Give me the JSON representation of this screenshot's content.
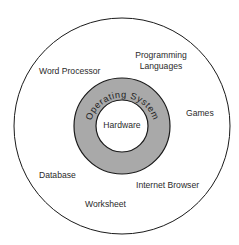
{
  "diagram": {
    "type": "concentric-layers",
    "colors": {
      "background": "#ffffff",
      "outline": "#1a1a1a",
      "os_ring_fill": "#a9a9a9",
      "text": "#2a2a2a"
    },
    "layers": {
      "core": {
        "label": "Hardware"
      },
      "middle": {
        "label": "Operating System"
      },
      "outer": {
        "applications": [
          {
            "label": "Word Processor"
          },
          {
            "label_line1": "Programming",
            "label_line2": "Languages"
          },
          {
            "label": "Games"
          },
          {
            "label": "Internet Browser"
          },
          {
            "label": "Worksheet"
          },
          {
            "label": "Database"
          }
        ]
      }
    }
  }
}
